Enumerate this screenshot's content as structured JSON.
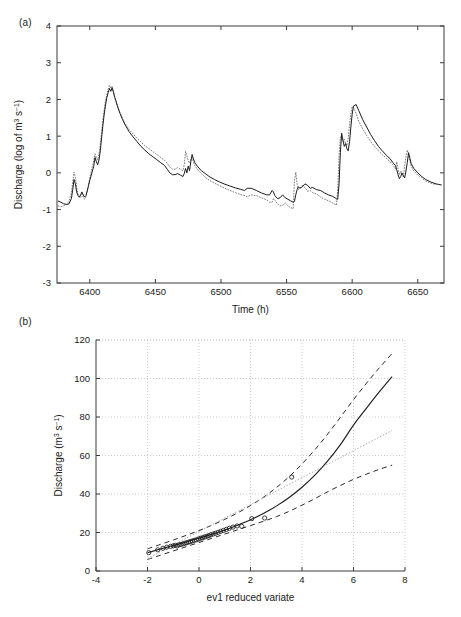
{
  "figure": {
    "panels": [
      {
        "id": "a",
        "label": "(a)"
      },
      {
        "id": "b",
        "label": "(b)"
      }
    ]
  },
  "chart_data": [
    {
      "id": "panel-a",
      "type": "line",
      "title": "",
      "panel_label": "(a)",
      "xlabel": "Time (h)",
      "ylabel": "Discharge (log of m3 s-1)",
      "ylabel_parts": {
        "main": "Discharge (log of m",
        "sup1": "3",
        "mid": " s",
        "sup2": "−1",
        "end": ")"
      },
      "xlim": [
        6375,
        6670
      ],
      "ylim": [
        -3,
        4
      ],
      "xticks": [
        6400,
        6450,
        6500,
        6550,
        6600,
        6650
      ],
      "xticklabels": [
        "6400",
        "6450",
        "6500",
        "6550",
        "6600",
        "6650"
      ],
      "yticks": [
        -3,
        -2,
        -1,
        0,
        1,
        2,
        3,
        4
      ],
      "yticklabels": [
        "-3",
        "-2",
        "-1",
        "0",
        "1",
        "2",
        "3",
        "4"
      ],
      "grid": false,
      "legend": "none",
      "series": [
        {
          "name": "observed",
          "style": "solid",
          "x": [
            6376,
            6378,
            6380,
            6382,
            6384,
            6386,
            6387,
            6388,
            6389,
            6390,
            6391,
            6392,
            6393,
            6394,
            6395,
            6396,
            6397,
            6398,
            6399,
            6400,
            6401,
            6402,
            6403,
            6404,
            6405,
            6406,
            6407,
            6408,
            6409,
            6410,
            6411,
            6412,
            6413,
            6414,
            6415,
            6416,
            6417,
            6418,
            6419,
            6420,
            6421,
            6423,
            6425,
            6427,
            6430,
            6433,
            6436,
            6439,
            6442,
            6445,
            6448,
            6451,
            6454,
            6457,
            6459,
            6461,
            6463,
            6465,
            6467,
            6469,
            6471,
            6472,
            6473,
            6474,
            6475,
            6476,
            6477,
            6478,
            6479,
            6480,
            6482,
            6485,
            6488,
            6491,
            6495,
            6499,
            6503,
            6507,
            6511,
            6515,
            6518,
            6520,
            6523,
            6527,
            6531,
            6535,
            6537,
            6539,
            6540,
            6541,
            6543,
            6545,
            6547,
            6549,
            6551,
            6553,
            6555,
            6556,
            6557,
            6558,
            6559,
            6560,
            6562,
            6564,
            6566,
            6568,
            6570,
            6573,
            6576,
            6579,
            6582,
            6585,
            6587,
            6588,
            6589,
            6590,
            6591,
            6592,
            6593,
            6594,
            6595,
            6596,
            6597,
            6598,
            6599,
            6600,
            6601,
            6603,
            6605,
            6608,
            6611,
            6614,
            6617,
            6620,
            6623,
            6626,
            6629,
            6631,
            6633,
            6634,
            6635,
            6636,
            6637,
            6638,
            6639,
            6640,
            6641,
            6642,
            6643,
            6644,
            6645,
            6647,
            6650,
            6653,
            6656,
            6660,
            6664,
            6668
          ],
          "y": [
            -0.77,
            -0.8,
            -0.84,
            -0.86,
            -0.85,
            -0.7,
            -0.45,
            -0.18,
            -0.3,
            -0.52,
            -0.62,
            -0.66,
            -0.6,
            -0.52,
            -0.6,
            -0.66,
            -0.62,
            -0.5,
            -0.35,
            -0.2,
            -0.08,
            0.05,
            0.18,
            0.42,
            0.3,
            0.22,
            0.35,
            0.6,
            0.95,
            1.3,
            1.6,
            1.85,
            2.05,
            2.18,
            2.3,
            2.22,
            2.32,
            2.2,
            2.05,
            1.95,
            1.82,
            1.62,
            1.45,
            1.3,
            1.12,
            0.98,
            0.85,
            0.72,
            0.62,
            0.52,
            0.44,
            0.36,
            0.28,
            0.2,
            0.1,
            0.0,
            -0.05,
            -0.05,
            -0.02,
            -0.06,
            -0.1,
            -0.02,
            0.12,
            0.0,
            0.18,
            0.06,
            0.3,
            0.5,
            0.38,
            0.28,
            0.18,
            0.06,
            -0.02,
            -0.1,
            -0.18,
            -0.25,
            -0.31,
            -0.36,
            -0.41,
            -0.45,
            -0.48,
            -0.42,
            -0.42,
            -0.48,
            -0.55,
            -0.6,
            -0.6,
            -0.48,
            -0.52,
            -0.62,
            -0.7,
            -0.68,
            -0.6,
            -0.68,
            -0.72,
            -0.76,
            -0.8,
            -0.78,
            -0.6,
            -0.46,
            -0.38,
            -0.42,
            -0.38,
            -0.3,
            -0.34,
            -0.42,
            -0.4,
            -0.46,
            -0.48,
            -0.55,
            -0.6,
            -0.64,
            -0.68,
            -0.71,
            -0.72,
            -0.3,
            0.55,
            1.08,
            0.88,
            0.72,
            0.8,
            0.66,
            0.6,
            0.85,
            1.25,
            1.6,
            1.82,
            1.86,
            1.7,
            1.45,
            1.25,
            1.05,
            0.88,
            0.72,
            0.6,
            0.48,
            0.38,
            0.28,
            0.2,
            0.08,
            -0.05,
            -0.16,
            -0.1,
            0.0,
            -0.08,
            -0.14,
            0.05,
            0.28,
            0.55,
            0.4,
            0.25,
            0.12,
            0.0,
            -0.1,
            -0.18,
            -0.25,
            -0.3,
            -0.33
          ]
        },
        {
          "name": "simulated",
          "style": "dotted",
          "x": [
            6376,
            6378,
            6380,
            6382,
            6384,
            6386,
            6387,
            6388,
            6389,
            6390,
            6391,
            6392,
            6393,
            6394,
            6395,
            6396,
            6397,
            6398,
            6399,
            6400,
            6401,
            6402,
            6403,
            6404,
            6405,
            6406,
            6407,
            6408,
            6409,
            6410,
            6411,
            6412,
            6413,
            6414,
            6415,
            6416,
            6417,
            6418,
            6419,
            6420,
            6421,
            6423,
            6425,
            6427,
            6430,
            6433,
            6436,
            6439,
            6442,
            6445,
            6448,
            6451,
            6454,
            6457,
            6459,
            6461,
            6463,
            6465,
            6467,
            6469,
            6471,
            6472,
            6473,
            6474,
            6475,
            6476,
            6477,
            6478,
            6479,
            6480,
            6482,
            6485,
            6488,
            6491,
            6495,
            6499,
            6503,
            6507,
            6511,
            6515,
            6518,
            6520,
            6523,
            6527,
            6531,
            6535,
            6537,
            6539,
            6540,
            6541,
            6543,
            6545,
            6547,
            6549,
            6551,
            6553,
            6555,
            6556,
            6557,
            6558,
            6559,
            6560,
            6562,
            6564,
            6566,
            6568,
            6570,
            6573,
            6576,
            6579,
            6582,
            6585,
            6587,
            6588,
            6589,
            6590,
            6591,
            6592,
            6593,
            6594,
            6595,
            6596,
            6597,
            6598,
            6599,
            6600,
            6601,
            6603,
            6605,
            6608,
            6611,
            6614,
            6617,
            6620,
            6623,
            6626,
            6629,
            6631,
            6633,
            6634,
            6635,
            6636,
            6637,
            6638,
            6639,
            6640,
            6641,
            6642,
            6643,
            6644,
            6645,
            6647,
            6650,
            6653,
            6656,
            6660,
            6664,
            6668
          ],
          "y": [
            -0.9,
            -0.92,
            -0.9,
            -0.86,
            -0.78,
            -0.55,
            -0.25,
            0.02,
            -0.12,
            -0.4,
            -0.58,
            -0.68,
            -0.66,
            -0.58,
            -0.66,
            -0.72,
            -0.66,
            -0.52,
            -0.35,
            -0.14,
            0.02,
            0.18,
            0.32,
            0.52,
            0.42,
            0.35,
            0.5,
            0.78,
            1.1,
            1.45,
            1.72,
            1.98,
            2.14,
            2.28,
            2.38,
            2.3,
            2.36,
            2.22,
            2.08,
            1.96,
            1.84,
            1.64,
            1.48,
            1.34,
            1.18,
            1.06,
            0.94,
            0.84,
            0.74,
            0.66,
            0.58,
            0.5,
            0.42,
            0.34,
            0.26,
            0.16,
            0.1,
            0.1,
            0.14,
            0.1,
            0.06,
            0.22,
            0.58,
            0.46,
            0.34,
            0.26,
            0.36,
            0.42,
            0.3,
            0.2,
            0.1,
            -0.02,
            -0.12,
            -0.2,
            -0.28,
            -0.35,
            -0.42,
            -0.48,
            -0.54,
            -0.59,
            -0.62,
            -0.65,
            -0.6,
            -0.62,
            -0.68,
            -0.74,
            -0.8,
            -0.8,
            -0.7,
            -0.74,
            -0.84,
            -0.9,
            -0.88,
            -0.82,
            -0.9,
            -0.94,
            -0.98,
            -0.22,
            0.02,
            -0.3,
            -0.45,
            -0.42,
            -0.34,
            -0.4,
            -0.5,
            -0.48,
            -0.54,
            -0.58,
            -0.66,
            -0.72,
            -0.76,
            -0.82,
            -0.86,
            -0.88,
            -0.45,
            0.45,
            0.98,
            0.95,
            0.86,
            0.92,
            0.8,
            0.74,
            0.95,
            1.3,
            1.62,
            1.8,
            1.78,
            1.62,
            1.4,
            1.2,
            1.02,
            0.86,
            0.72,
            0.6,
            0.5,
            0.4,
            0.3,
            0.22,
            0.1,
            0.3,
            0.1,
            -0.05,
            0.05,
            -0.04,
            -0.1,
            0.2,
            0.45,
            0.62,
            0.48,
            0.32,
            0.18,
            0.05,
            -0.06,
            -0.14,
            -0.22,
            -0.28,
            -0.32
          ]
        }
      ]
    },
    {
      "id": "panel-b",
      "type": "scatter",
      "title": "",
      "panel_label": "(b)",
      "xlabel": "ev1 reduced variate",
      "ylabel": "Discharge (m3 s-1)",
      "ylabel_parts": {
        "main": "Discharge (m",
        "sup1": "3",
        "mid": " s",
        "sup2": "−1",
        "end": ")"
      },
      "xlim": [
        -4,
        8
      ],
      "ylim": [
        0,
        120
      ],
      "xticks": [
        -4,
        -2,
        0,
        2,
        4,
        6,
        8
      ],
      "xticklabels": [
        "-4",
        "-2",
        "0",
        "2",
        "4",
        "6",
        "8"
      ],
      "yticks": [
        0,
        20,
        40,
        60,
        80,
        100,
        120
      ],
      "yticklabels": [
        "0",
        "20",
        "40",
        "60",
        "80",
        "100",
        "120"
      ],
      "grid": true,
      "legend": "none",
      "points": {
        "name": "observed annual maxima",
        "marker": "circle",
        "x": [
          -1.95,
          -1.6,
          -1.4,
          -1.25,
          -1.1,
          -1.0,
          -0.92,
          -0.85,
          -0.78,
          -0.7,
          -0.62,
          -0.55,
          -0.48,
          -0.4,
          -0.33,
          -0.26,
          -0.18,
          -0.1,
          -0.02,
          0.06,
          0.14,
          0.22,
          0.3,
          0.38,
          0.46,
          0.55,
          0.64,
          0.74,
          0.84,
          0.95,
          1.06,
          1.18,
          1.32,
          1.48,
          1.66,
          2.05,
          2.55,
          3.6
        ],
        "y": [
          9.5,
          11.0,
          11.8,
          12.4,
          12.8,
          13.1,
          13.4,
          13.0,
          13.6,
          13.8,
          14.1,
          14.4,
          14.7,
          15.0,
          15.3,
          15.6,
          15.9,
          16.2,
          16.6,
          17.0,
          17.3,
          17.7,
          18.0,
          18.4,
          18.8,
          19.2,
          19.6,
          20.1,
          20.6,
          21.1,
          21.6,
          22.2,
          22.8,
          23.4,
          23.2,
          27.2,
          27.5,
          48.8
        ]
      },
      "curves": [
        {
          "name": "fitted-distribution",
          "style": "solid",
          "x": [
            -2.0,
            -1.5,
            -1.0,
            -0.5,
            0.0,
            0.5,
            1.0,
            1.5,
            2.0,
            2.5,
            3.0,
            3.5,
            4.0,
            4.5,
            5.0,
            5.5,
            6.0,
            6.5,
            7.0,
            7.5
          ],
          "y": [
            9.5,
            11.4,
            13.2,
            15.1,
            17.0,
            19.1,
            21.3,
            23.8,
            26.6,
            29.9,
            33.7,
            38.2,
            43.5,
            49.8,
            57.2,
            65.8,
            75.8,
            84.5,
            93.0,
            101.0
          ]
        },
        {
          "name": "upper-confidence-limit",
          "style": "dashed",
          "x": [
            -2.0,
            -1.5,
            -1.0,
            -0.5,
            0.0,
            0.5,
            1.0,
            1.5,
            2.0,
            2.5,
            3.0,
            3.5,
            4.0,
            4.5,
            5.0,
            5.5,
            6.0,
            6.5,
            7.0,
            7.5
          ],
          "y": [
            11.5,
            13.8,
            16.1,
            18.5,
            21.0,
            23.8,
            26.8,
            30.2,
            34.0,
            38.3,
            43.3,
            49.0,
            55.6,
            63.0,
            71.2,
            80.0,
            89.0,
            97.5,
            105.5,
            113.0
          ]
        },
        {
          "name": "lower-confidence-limit",
          "style": "dashed",
          "x": [
            -2.0,
            -1.5,
            -1.0,
            -0.5,
            0.0,
            0.5,
            1.0,
            1.5,
            2.0,
            2.5,
            3.0,
            3.5,
            4.0,
            4.5,
            5.0,
            5.5,
            6.0,
            6.5,
            7.0,
            7.5
          ],
          "y": [
            6.0,
            8.2,
            10.4,
            12.6,
            14.8,
            17.0,
            19.2,
            21.4,
            23.6,
            25.8,
            28.2,
            31.0,
            34.2,
            37.6,
            41.2,
            44.5,
            47.6,
            50.3,
            52.8,
            55.0
          ]
        },
        {
          "name": "reference-line",
          "style": "thin-dotted",
          "x": [
            -2.0,
            7.5
          ],
          "y": [
            6.5,
            73.0
          ]
        }
      ]
    }
  ]
}
